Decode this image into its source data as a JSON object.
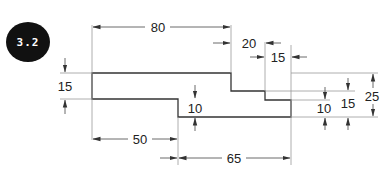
{
  "badge": {
    "label": "3.2",
    "color": "#111111",
    "text_color": "#ffffff"
  },
  "shape": {
    "description": "Stepped profile outline",
    "stroke_color": "#333333"
  },
  "dimensions": {
    "overall_top_length": "80",
    "step_width_upper": "20",
    "step_width_lower": "15",
    "left_height": "15",
    "bottom_left_length": "50",
    "bottom_step_height": "10",
    "bottom_right_length": "65",
    "right_step_10": "10",
    "right_step_15": "15",
    "overall_height": "25"
  }
}
